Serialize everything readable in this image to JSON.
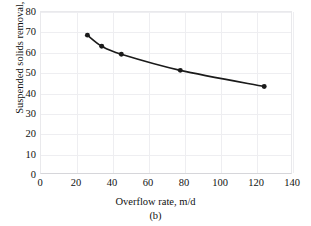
{
  "chart_data": {
    "type": "line",
    "title": "",
    "subcaption": "(b)",
    "xlabel": "Overflow rate, m/d",
    "ylabel": "Suspended solids removal, %",
    "xlim": [
      0,
      140
    ],
    "ylim": [
      0,
      80
    ],
    "xticks": [
      0,
      20,
      40,
      60,
      80,
      100,
      120,
      140
    ],
    "yticks": [
      0,
      10,
      20,
      30,
      40,
      50,
      60,
      70,
      80
    ],
    "grid": true,
    "legend": "none",
    "marker": "filled-circle",
    "line_color": "#1a1a1a",
    "marker_color": "#1a1a1a",
    "grid_color": "#eeeef1",
    "series": [
      {
        "name": "Suspended solids removal",
        "x": [
          26,
          34,
          45,
          78,
          125
        ],
        "y": [
          68.5,
          63,
          59,
          51,
          43
        ]
      }
    ]
  },
  "axes": {
    "x_tick_labels": [
      "0",
      "20",
      "40",
      "60",
      "80",
      "100",
      "120",
      "140"
    ],
    "y_tick_labels": [
      "0",
      "10",
      "20",
      "30",
      "40",
      "50",
      "60",
      "70",
      "80"
    ]
  },
  "labels": {
    "x_axis_title": "Overflow rate, m/d",
    "y_axis_title": "Suspended solids removal, %",
    "figure_caption": "(b)"
  }
}
